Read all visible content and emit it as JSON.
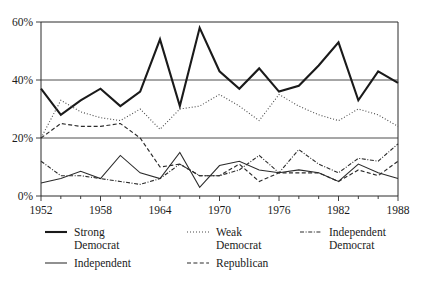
{
  "chart_data": {
    "type": "line",
    "title": "",
    "subtitle": "",
    "xlabel": "",
    "ylabel": "",
    "x": [
      1952,
      1954,
      1956,
      1958,
      1960,
      1962,
      1964,
      1966,
      1968,
      1970,
      1972,
      1974,
      1976,
      1978,
      1980,
      1982,
      1984,
      1986,
      1988
    ],
    "xlim": [
      1952,
      1988
    ],
    "ylim": [
      0,
      60
    ],
    "y_ticks": [
      0,
      20,
      40,
      60
    ],
    "y_tick_labels": [
      "0%",
      "20%",
      "40%",
      "60%"
    ],
    "x_ticks": [
      1952,
      1954,
      1956,
      1958,
      1960,
      1962,
      1964,
      1966,
      1968,
      1970,
      1972,
      1974,
      1976,
      1978,
      1980,
      1982,
      1984,
      1986,
      1988
    ],
    "x_tick_labels_shown": [
      "1952",
      "1958",
      "1964",
      "1970",
      "1976",
      "1982",
      "1988"
    ],
    "x_labelled_years": [
      1952,
      1958,
      1964,
      1970,
      1976,
      1982,
      1988
    ],
    "grid": "horizontal",
    "gridlines_at": [
      20,
      40
    ],
    "legend_position": "below-plot",
    "series": [
      {
        "name": "Strong Democrat",
        "name_line1": "Strong",
        "name_line2": "Democrat",
        "style": "solid-thick",
        "color": "#1a1a1a",
        "width": 2.1,
        "dash": "none",
        "values": [
          37,
          28,
          33,
          37,
          31,
          36,
          54,
          31,
          58,
          43,
          37,
          44,
          36,
          38,
          45,
          53,
          33,
          43,
          39
        ]
      },
      {
        "name": "Weak Democrat",
        "name_line1": "Weak",
        "name_line2": "Democrat",
        "style": "dotted",
        "color": "#4a4a4a",
        "width": 1.1,
        "dash": "1,2",
        "values": [
          20,
          33,
          29,
          27,
          26,
          30,
          23,
          30,
          31,
          35,
          31,
          26,
          35,
          31,
          28,
          26,
          30,
          28,
          24
        ]
      },
      {
        "name": "Independent Democrat",
        "name_line1": "Independent",
        "name_line2": "Democrat",
        "style": "dash-dot",
        "color": "#2b2b2b",
        "width": 1.1,
        "dash": "4,1.6,1,1.6",
        "values": [
          12,
          7,
          7,
          6,
          5,
          4,
          6,
          11,
          7,
          7,
          9,
          14,
          8,
          16,
          11,
          8,
          13,
          12,
          18
        ]
      },
      {
        "name": "Independent",
        "name_line1": "Independent",
        "name_line2": "",
        "style": "solid-thin",
        "color": "#2b2b2b",
        "width": 1.05,
        "dash": "none",
        "values": [
          4.5,
          6,
          8.5,
          6,
          14,
          8,
          6,
          15,
          3,
          10.5,
          12,
          9,
          8,
          9,
          8,
          5,
          11,
          8,
          6
        ]
      },
      {
        "name": "Republican",
        "name_line1": "Republican",
        "name_line2": "",
        "style": "dashed",
        "color": "#2b2b2b",
        "width": 1.15,
        "dash": "4,2.4",
        "values": [
          20,
          25,
          24,
          24,
          25,
          20,
          10,
          11,
          7,
          7,
          11,
          5,
          8,
          8,
          8,
          5,
          9,
          7,
          12
        ]
      }
    ]
  },
  "axes": {
    "y_labels": [
      "60%",
      "40%",
      "20%",
      "0%"
    ],
    "x_labels": [
      "1952",
      "1958",
      "1964",
      "1970",
      "1976",
      "1982",
      "1988"
    ]
  },
  "legend": {
    "row1": [
      {
        "label_line1": "Strong",
        "label_line2": "Democrat"
      },
      {
        "label_line1": "Weak",
        "label_line2": "Democrat"
      },
      {
        "label_line1": "Independent",
        "label_line2": "Democrat"
      }
    ],
    "row2": [
      {
        "label_line1": "Independent",
        "label_line2": ""
      },
      {
        "label_line1": "Republican",
        "label_line2": ""
      }
    ]
  },
  "colors": {
    "background": "#ffffff",
    "ink": "#1a1a1a",
    "grid": "#3a3a3a"
  }
}
